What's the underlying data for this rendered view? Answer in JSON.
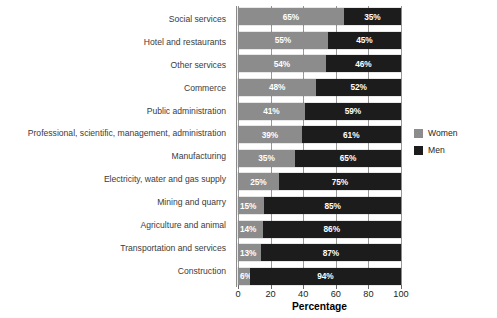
{
  "chart_data": {
    "type": "bar",
    "subtype": "horizontal-stacked-100",
    "title": "",
    "xlabel": "Percentage",
    "ylabel": "",
    "xlim": [
      0,
      100
    ],
    "xticks": [
      0,
      20,
      40,
      60,
      80,
      100
    ],
    "xtick_labels": [
      "0",
      "20",
      "40",
      "60",
      "80",
      "100"
    ],
    "grid": true,
    "grid_axis": "x",
    "legend_position": "right",
    "categories": [
      "Social services",
      "Hotel and restaurants",
      "Other services",
      "Commerce",
      "Public administration",
      "Professional, scientific, management, administration",
      "Manufacturing",
      "Electricity, water and gas supply",
      "Mining and quarry",
      "Agriculture and animal",
      "Transportation and services",
      "Construction"
    ],
    "series": [
      {
        "name": "Women",
        "color": "#8c8c8c",
        "values": [
          65,
          55,
          54,
          48,
          41,
          39,
          35,
          25,
          15,
          14,
          13,
          6
        ],
        "labels": [
          "65%",
          "55%",
          "54%",
          "48%",
          "41%",
          "39%",
          "35%",
          "25%",
          "15%",
          "14%",
          "13%",
          "6%"
        ]
      },
      {
        "name": "Men",
        "color": "#1c1c1c",
        "values": [
          35,
          45,
          46,
          52,
          59,
          61,
          65,
          75,
          85,
          86,
          87,
          94
        ],
        "labels": [
          "35%",
          "45%",
          "46%",
          "52%",
          "59%",
          "61%",
          "65%",
          "75%",
          "85%",
          "86%",
          "87%",
          "94%"
        ]
      }
    ]
  },
  "legend": {
    "items": [
      {
        "label": "Women",
        "swatch": "women-swatch-icon"
      },
      {
        "label": "Men",
        "swatch": "men-swatch-icon"
      }
    ]
  }
}
